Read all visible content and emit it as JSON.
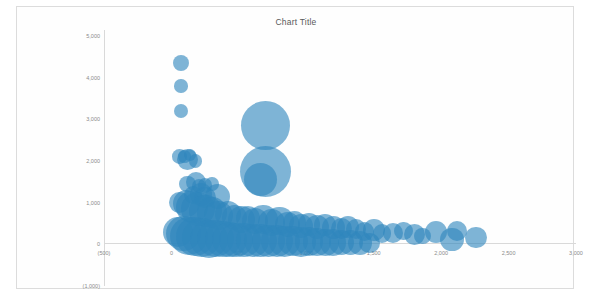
{
  "chart": {
    "title": "Chart Title",
    "accent_color": "#2E86BD",
    "axis_color": "#D9D9D9",
    "tick_text_color": "#8A8A8A",
    "frame_border_color": "#DCDCDC",
    "background": "#FFFFFF"
  },
  "chart_data": {
    "type": "scatter",
    "title": "Chart Title",
    "subtitle": "",
    "xlabel": "",
    "ylabel": "",
    "xlim": [
      -500,
      3000
    ],
    "ylim": [
      -1000,
      5000
    ],
    "grid": false,
    "legend": null,
    "legend_position": "none",
    "x_ticks": [
      "(500)",
      "0",
      "500",
      "1,000",
      "1,500",
      "2,000",
      "2,500",
      "3,000"
    ],
    "y_ticks": [
      "5,000",
      "4,000",
      "3,000",
      "2,000",
      "1,000",
      "0",
      "(1,000)"
    ],
    "x_tick_values": [
      -500,
      0,
      500,
      1000,
      1500,
      2000,
      2500,
      3000
    ],
    "y_tick_values": [
      5000,
      4000,
      3000,
      2000,
      1000,
      0,
      -1000
    ],
    "series": [
      {
        "name": "Series 1",
        "marker": "bubble",
        "color": "#2E86BD",
        "opacity": 0.62,
        "points": [
          {
            "x": 70,
            "y": 4350,
            "size": 70
          },
          {
            "x": 70,
            "y": 3800,
            "size": 50
          },
          {
            "x": 72,
            "y": 3200,
            "size": 55
          },
          {
            "x": 60,
            "y": 2100,
            "size": 60
          },
          {
            "x": 95,
            "y": 2100,
            "size": 45
          },
          {
            "x": 118,
            "y": 2040,
            "size": 120
          },
          {
            "x": 140,
            "y": 2150,
            "size": 40
          },
          {
            "x": 180,
            "y": 2000,
            "size": 50
          },
          {
            "x": 700,
            "y": 2850,
            "size": 660
          },
          {
            "x": 700,
            "y": 1750,
            "size": 720
          },
          {
            "x": 660,
            "y": 1550,
            "size": 300
          },
          {
            "x": 120,
            "y": 1450,
            "size": 75
          },
          {
            "x": 180,
            "y": 1500,
            "size": 110
          },
          {
            "x": 205,
            "y": 1400,
            "size": 55
          },
          {
            "x": 250,
            "y": 1420,
            "size": 60
          },
          {
            "x": 300,
            "y": 1450,
            "size": 50
          },
          {
            "x": 340,
            "y": 1150,
            "size": 180
          },
          {
            "x": 160,
            "y": 1180,
            "size": 90
          },
          {
            "x": 220,
            "y": 1200,
            "size": 140
          },
          {
            "x": 250,
            "y": 1120,
            "size": 130
          },
          {
            "x": 60,
            "y": 1000,
            "size": 120
          },
          {
            "x": 110,
            "y": 980,
            "size": 200
          },
          {
            "x": 150,
            "y": 900,
            "size": 280
          },
          {
            "x": 200,
            "y": 850,
            "size": 320
          },
          {
            "x": 250,
            "y": 800,
            "size": 300
          },
          {
            "x": 300,
            "y": 760,
            "size": 260
          },
          {
            "x": 350,
            "y": 700,
            "size": 230
          },
          {
            "x": 420,
            "y": 720,
            "size": 190
          },
          {
            "x": 470,
            "y": 650,
            "size": 170
          },
          {
            "x": 520,
            "y": 600,
            "size": 210
          },
          {
            "x": 570,
            "y": 640,
            "size": 160
          },
          {
            "x": 620,
            "y": 560,
            "size": 190
          },
          {
            "x": 680,
            "y": 600,
            "size": 240
          },
          {
            "x": 740,
            "y": 520,
            "size": 200
          },
          {
            "x": 800,
            "y": 560,
            "size": 230
          },
          {
            "x": 860,
            "y": 480,
            "size": 180
          },
          {
            "x": 910,
            "y": 520,
            "size": 150
          },
          {
            "x": 960,
            "y": 440,
            "size": 170
          },
          {
            "x": 1020,
            "y": 480,
            "size": 140
          },
          {
            "x": 1080,
            "y": 420,
            "size": 160
          },
          {
            "x": 1140,
            "y": 460,
            "size": 130
          },
          {
            "x": 1200,
            "y": 400,
            "size": 150
          },
          {
            "x": 1260,
            "y": 380,
            "size": 120
          },
          {
            "x": 1310,
            "y": 420,
            "size": 140
          },
          {
            "x": 1370,
            "y": 360,
            "size": 110
          },
          {
            "x": 1430,
            "y": 300,
            "size": 100
          },
          {
            "x": 1500,
            "y": 340,
            "size": 130
          },
          {
            "x": 1560,
            "y": 260,
            "size": 90
          },
          {
            "x": 1640,
            "y": 280,
            "size": 110
          },
          {
            "x": 1720,
            "y": 320,
            "size": 95
          },
          {
            "x": 1800,
            "y": 240,
            "size": 120
          },
          {
            "x": 1860,
            "y": 200,
            "size": 80
          },
          {
            "x": 1960,
            "y": 300,
            "size": 140
          },
          {
            "x": 2080,
            "y": 120,
            "size": 150
          },
          {
            "x": 2120,
            "y": 320,
            "size": 110
          },
          {
            "x": 2260,
            "y": 160,
            "size": 130
          },
          {
            "x": 50,
            "y": 300,
            "size": 260
          },
          {
            "x": 90,
            "y": 250,
            "size": 340
          },
          {
            "x": 130,
            "y": 200,
            "size": 400
          },
          {
            "x": 175,
            "y": 180,
            "size": 420
          },
          {
            "x": 225,
            "y": 160,
            "size": 430
          },
          {
            "x": 275,
            "y": 140,
            "size": 400
          },
          {
            "x": 325,
            "y": 130,
            "size": 380
          },
          {
            "x": 380,
            "y": 120,
            "size": 360
          },
          {
            "x": 430,
            "y": 110,
            "size": 340
          },
          {
            "x": 480,
            "y": 100,
            "size": 330
          },
          {
            "x": 540,
            "y": 100,
            "size": 320
          },
          {
            "x": 600,
            "y": 90,
            "size": 300
          },
          {
            "x": 660,
            "y": 90,
            "size": 310
          },
          {
            "x": 720,
            "y": 80,
            "size": 290
          },
          {
            "x": 780,
            "y": 80,
            "size": 280
          },
          {
            "x": 840,
            "y": 70,
            "size": 260
          },
          {
            "x": 900,
            "y": 70,
            "size": 250
          },
          {
            "x": 960,
            "y": 60,
            "size": 240
          },
          {
            "x": 1020,
            "y": 60,
            "size": 230
          },
          {
            "x": 1080,
            "y": 50,
            "size": 220
          },
          {
            "x": 1140,
            "y": 50,
            "size": 200
          },
          {
            "x": 1200,
            "y": 45,
            "size": 190
          },
          {
            "x": 1260,
            "y": 40,
            "size": 180
          },
          {
            "x": 1330,
            "y": 40,
            "size": 170
          },
          {
            "x": 1400,
            "y": 35,
            "size": 160
          },
          {
            "x": 1470,
            "y": 30,
            "size": 120
          }
        ]
      }
    ]
  }
}
